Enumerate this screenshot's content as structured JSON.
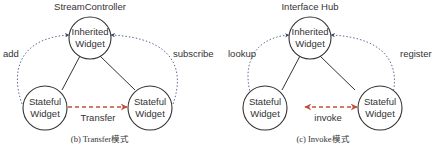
{
  "panels": [
    {
      "id": "b",
      "title": "StreamController",
      "caption": "(b) Transfer模式",
      "nodes": {
        "top": {
          "line1": "Inherited",
          "line2": "Widget"
        },
        "left": {
          "line1": "Stateful",
          "line2": "Widget"
        },
        "right": {
          "line1": "Stateful",
          "line2": "Widget"
        }
      },
      "edges": {
        "left_dotted": "add",
        "right_dotted": "subscribe",
        "bottom_dashed": "Transfer"
      },
      "bottom_direction": "one-way"
    },
    {
      "id": "c",
      "title": "Interface Hub",
      "caption": "(c) Invoke模式",
      "nodes": {
        "top": {
          "line1": "Inherited",
          "line2": "Widget"
        },
        "left": {
          "line1": "Stateful",
          "line2": "Widget"
        },
        "right": {
          "line1": "Stateful",
          "line2": "Widget"
        }
      },
      "edges": {
        "left_dotted": "lookup",
        "right_dotted": "register",
        "bottom_dashed": "invoke"
      },
      "bottom_direction": "two-way"
    }
  ],
  "colors": {
    "node_stroke": "#333333",
    "dotted_arrow": "#4a5a8a",
    "dashed_arrow": "#c0503a",
    "text": "#333333"
  }
}
